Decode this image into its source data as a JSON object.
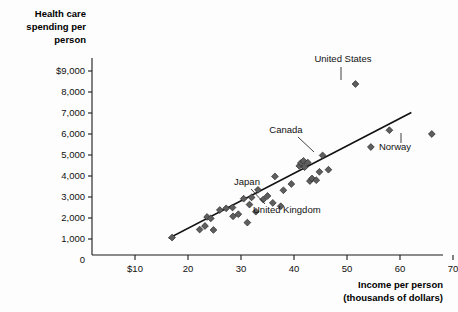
{
  "chart_data": {
    "type": "scatter",
    "title": "",
    "xlabel": "Income per person (thousands of dollars)",
    "xlabel_line1": "Income per person",
    "xlabel_line2": "(thousands of dollars)",
    "ylabel": "Health care spending per person",
    "ylabel_line1": "Health care",
    "ylabel_line2": "spending per",
    "ylabel_line3": "person",
    "xlim": [
      0,
      72
    ],
    "ylim": [
      0,
      9600
    ],
    "grid": false,
    "legend": "none",
    "x_ticks": [
      {
        "value": 10,
        "label": "$10"
      },
      {
        "value": 20,
        "label": "20"
      },
      {
        "value": 30,
        "label": "30"
      },
      {
        "value": 40,
        "label": "40"
      },
      {
        "value": 50,
        "label": "50"
      },
      {
        "value": 60,
        "label": "60"
      },
      {
        "value": 70,
        "label": "70"
      }
    ],
    "y_ticks": [
      {
        "value": 9000,
        "label": "$9,000"
      },
      {
        "value": 8000,
        "label": "8,000"
      },
      {
        "value": 7000,
        "label": "7,000"
      },
      {
        "value": 6000,
        "label": "6,000"
      },
      {
        "value": 5000,
        "label": "5,000"
      },
      {
        "value": 4000,
        "label": "4,000"
      },
      {
        "value": 3000,
        "label": "3,000"
      },
      {
        "value": 2000,
        "label": "2,000"
      },
      {
        "value": 1000,
        "label": "1,000"
      },
      {
        "value": 0,
        "label": "0"
      }
    ],
    "trend_line": {
      "x0": 16.5,
      "y0": 1050,
      "x1": 62.0,
      "y1": 7000
    },
    "points": [
      {
        "x": 17.0,
        "y": 1070
      },
      {
        "x": 22.2,
        "y": 1450
      },
      {
        "x": 23.2,
        "y": 1620
      },
      {
        "x": 23.6,
        "y": 2050
      },
      {
        "x": 24.3,
        "y": 1980
      },
      {
        "x": 24.8,
        "y": 1430
      },
      {
        "x": 26.0,
        "y": 2380
      },
      {
        "x": 27.2,
        "y": 2460
      },
      {
        "x": 28.4,
        "y": 2500
      },
      {
        "x": 28.5,
        "y": 2080
      },
      {
        "x": 29.5,
        "y": 2180
      },
      {
        "x": 30.5,
        "y": 2920
      },
      {
        "x": 31.2,
        "y": 1780
      },
      {
        "x": 31.6,
        "y": 2640
      },
      {
        "x": 32.0,
        "y": 2980
      },
      {
        "x": 32.8,
        "y": 2300
      },
      {
        "x": 33.2,
        "y": 3340
      },
      {
        "x": 34.2,
        "y": 2880
      },
      {
        "x": 35.0,
        "y": 3050
      },
      {
        "x": 36.0,
        "y": 2720
      },
      {
        "x": 36.4,
        "y": 3980
      },
      {
        "x": 37.5,
        "y": 2560
      },
      {
        "x": 38.0,
        "y": 3320
      },
      {
        "x": 39.5,
        "y": 3620
      },
      {
        "x": 41.0,
        "y": 4480
      },
      {
        "x": 41.3,
        "y": 4620
      },
      {
        "x": 41.8,
        "y": 4720
      },
      {
        "x": 42.0,
        "y": 4420
      },
      {
        "x": 42.6,
        "y": 4640
      },
      {
        "x": 43.0,
        "y": 3760
      },
      {
        "x": 43.4,
        "y": 3880
      },
      {
        "x": 44.2,
        "y": 3800
      },
      {
        "x": 44.8,
        "y": 4200
      },
      {
        "x": 45.4,
        "y": 4980
      },
      {
        "x": 46.5,
        "y": 4300
      },
      {
        "x": 51.6,
        "y": 8380
      },
      {
        "x": 54.5,
        "y": 5380
      },
      {
        "x": 58.0,
        "y": 6180
      },
      {
        "x": 66.0,
        "y": 6000
      }
    ],
    "annotations": [
      {
        "label": "United States",
        "label_x": 343,
        "label_y": 62,
        "leader": {
          "x1": 341,
          "y1": 67,
          "x2": 341,
          "y2": 80
        },
        "anchor": "middle"
      },
      {
        "label": "Canada",
        "label_x": 286,
        "label_y": 133,
        "leader": {
          "x1": 298,
          "y1": 137,
          "x2": 314,
          "y2": 152
        },
        "anchor": "middle"
      },
      {
        "label": "Japan",
        "label_x": 247,
        "label_y": 185,
        "leader": {
          "x1": 251,
          "y1": 189,
          "x2": 265,
          "y2": 204
        },
        "anchor": "middle"
      },
      {
        "label": "United Kingdom",
        "label_x": 253,
        "label_y": 213,
        "leader": null,
        "anchor": "start"
      },
      {
        "label": "Norway",
        "label_x": 395,
        "label_y": 150,
        "leader": {
          "x1": 401,
          "y1": 143,
          "x2": 401,
          "y2": 133
        },
        "anchor": "middle"
      }
    ]
  }
}
